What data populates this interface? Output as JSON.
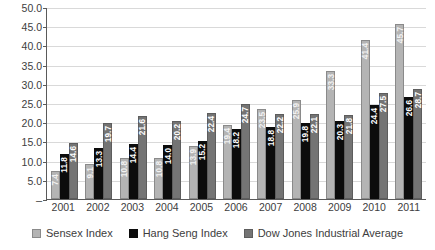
{
  "chart_data": {
    "type": "bar",
    "title": "",
    "subtitle": "",
    "xlabel": "",
    "ylabel": "",
    "ylim": [
      0,
      50
    ],
    "ytick_step": 5,
    "grid": true,
    "legend_position": "bottom",
    "categories": [
      "2001",
      "2002",
      "2003",
      "2004",
      "2005",
      "2006",
      "2007",
      "2008",
      "2009",
      "2010",
      "2011"
    ],
    "ytick_labels": [
      "50.0",
      "45.0",
      "40.0",
      "35.0",
      "30.0",
      "25.0",
      "20.0",
      "15.0",
      "10.0",
      "5.0",
      "–"
    ],
    "ytick_values": [
      50,
      45,
      40,
      35,
      30,
      25,
      20,
      15,
      10,
      5,
      0
    ],
    "series": [
      {
        "name": "Sensex Index",
        "color": "#b4b4b4",
        "values": [
          7.4,
          9.1,
          10.8,
          10.8,
          13.9,
          19.4,
          23.5,
          25.9,
          33.3,
          41.4,
          45.7
        ],
        "labels": [
          "7.4",
          "9.1",
          "10.8",
          "10.8",
          "13.9",
          "19.4",
          "23.5",
          "25.9",
          "33.3",
          "41.4",
          "45.7"
        ]
      },
      {
        "name": "Hang Seng Index",
        "color": "#0c0c0c",
        "values": [
          11.8,
          13.3,
          14.4,
          14.0,
          15.2,
          18.2,
          18.8,
          19.8,
          20.3,
          24.4,
          26.6
        ],
        "labels": [
          "11.8",
          "13.3",
          "14.4",
          "14.0",
          "15.2",
          "18.2",
          "18.8",
          "19.8",
          "20.3",
          "24.4",
          "26.6"
        ]
      },
      {
        "name": "Dow Jones Industrial Average",
        "color": "#747474",
        "values": [
          14.6,
          19.7,
          21.6,
          20.2,
          22.4,
          24.7,
          22.2,
          22.1,
          21.8,
          27.5,
          28.7
        ],
        "labels": [
          "14.6",
          "19.7",
          "21.6",
          "20.2",
          "22.4",
          "24.7",
          "22.2",
          "22.1",
          "21.8",
          "27.5",
          "28.7"
        ]
      }
    ]
  },
  "legend": {
    "items": [
      {
        "label": "Sensex Index",
        "swatch": "legend-swatch-sensex"
      },
      {
        "label": "Hang Seng Index",
        "swatch": "legend-swatch-hang-seng"
      },
      {
        "label": "Dow Jones Industrial Average",
        "swatch": "legend-swatch-dow-jones"
      }
    ]
  }
}
